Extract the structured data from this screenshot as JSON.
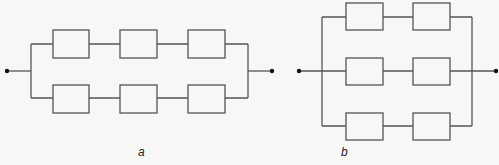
{
  "diagrams": [
    {
      "id": "a",
      "label": "a",
      "description": "Two parallel branches, each with three elements in series",
      "branches": 2,
      "elements_per_branch": 3
    },
    {
      "id": "b",
      "label": "b",
      "description": "Three parallel branches, each with two elements in series",
      "branches": 3,
      "elements_per_branch": 2
    }
  ],
  "colors": {
    "line": "#555555",
    "background": "#f7f7f5",
    "terminal": "#111111"
  }
}
